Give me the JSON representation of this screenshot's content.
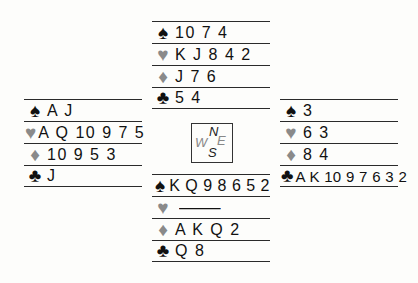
{
  "suit_icons": {
    "spades": "♠",
    "hearts": "♥",
    "diamonds": "♦",
    "clubs": "♣"
  },
  "colors": {
    "black_suits": "#111111",
    "red_suits_rendered_grey": "#8a8a8a",
    "lines": "#2a2a2a",
    "background": "#fdfdfb"
  },
  "compass": {
    "north": "N",
    "west": "W",
    "east": "E",
    "south": "S"
  },
  "hands": {
    "north": {
      "spades": "10 7 4",
      "hearts": "K J 8 4 2",
      "diamonds": "J 7 6",
      "clubs": "5 4"
    },
    "west": {
      "spades": "A J",
      "hearts": "A Q 10 9 7 5",
      "diamonds": "10 9 5 3",
      "clubs": "J"
    },
    "east": {
      "spades": "3",
      "hearts": "6 3",
      "diamonds": "8 4",
      "clubs": "A K 10 9 7 6 3 2"
    },
    "south": {
      "spades": "K Q 9 8 6 5 2",
      "hearts": "—",
      "diamonds": "A K Q 2",
      "clubs": "Q 8"
    }
  }
}
